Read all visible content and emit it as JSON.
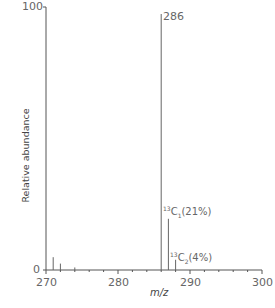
{
  "chart_data": {
    "type": "bar",
    "title": "",
    "xlabel": "m/z",
    "ylabel": "Relative abundance",
    "xlim": [
      270,
      300
    ],
    "ylim": [
      0,
      100
    ],
    "xticks": [
      270,
      280,
      290,
      300
    ],
    "yticks": [
      0,
      100
    ],
    "grid": false,
    "legend": null,
    "x": [
      271,
      272,
      274,
      286,
      287,
      288
    ],
    "values": [
      5,
      2.5,
      1,
      100,
      20,
      4
    ],
    "annotations": [
      {
        "x": 286,
        "text": "286",
        "type": "peak_label"
      },
      {
        "x": 287,
        "text_prefix": "13",
        "text_main": "C",
        "text_sub": "1",
        "text_suffix": "(21%)"
      },
      {
        "x": 288,
        "text_prefix": "13",
        "text_main": "C",
        "text_sub": "2",
        "text_suffix": "(4%)"
      }
    ]
  },
  "labels": {
    "y_top": "100",
    "y_bottom": "0",
    "x_ticks": [
      "270",
      "280",
      "290",
      "300"
    ],
    "x_axis": "m/z",
    "y_axis": "Relative abundance",
    "peak_main": "286",
    "iso1_sup": "13",
    "iso1_c": "C",
    "iso1_sub": "1",
    "iso1_pct": "(21%)",
    "iso2_sup": "13",
    "iso2_c": "C",
    "iso2_sub": "2",
    "iso2_pct": "(4%)"
  }
}
